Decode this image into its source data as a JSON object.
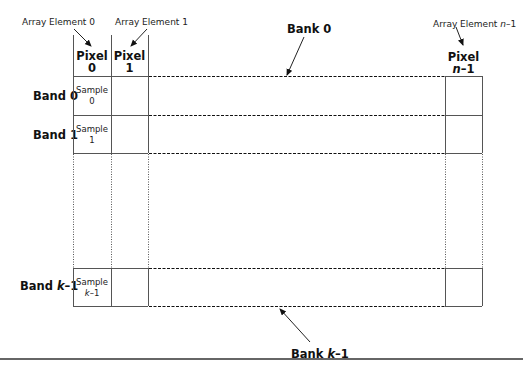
{
  "diagram": {
    "array_labels": {
      "element_0": "Array Element 0",
      "element_1": "Array Element 1",
      "element_last_prefix": "Array Element ",
      "element_last_var": "n",
      "element_last_suffix": "–1"
    },
    "columns": [
      {
        "title": "Pixel",
        "index": "0"
      },
      {
        "title": "Pixel",
        "index": "1"
      },
      {
        "title": "Pixel",
        "index_var": "n",
        "index_suffix": "–1"
      }
    ],
    "bands": [
      {
        "label": "Band 0",
        "sample_title": "Sample",
        "sample_index": "0"
      },
      {
        "label": "Band 1",
        "sample_title": "Sample",
        "sample_index": "1"
      },
      {
        "label_prefix": "Band ",
        "label_var": "k",
        "label_suffix": "–1",
        "sample_title": "Sample",
        "sample_index_var": "k",
        "sample_index_suffix": "–1"
      }
    ],
    "banks": {
      "top": "Bank 0",
      "bottom_prefix": "Bank ",
      "bottom_var": "k",
      "bottom_suffix": "–1"
    },
    "colors": {
      "line": "#555555",
      "dash": "#111111",
      "rule": "#666666"
    }
  }
}
